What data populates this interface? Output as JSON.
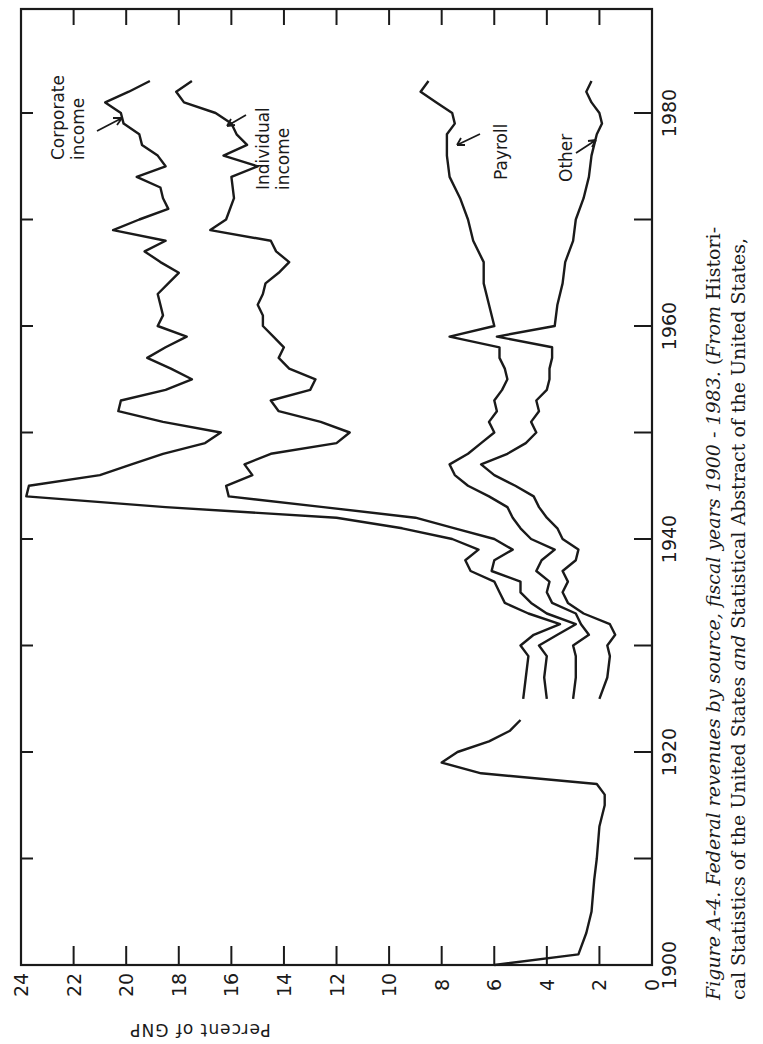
{
  "caption": {
    "line1_italic": "Figure A-4.   Federal revenues by source, fiscal years 1900 - 1983.",
    "line1_roman_prefix": "(",
    "line1_italic_from": "From",
    "line1_roman": " Histori-",
    "line2_a": "cal Statistics of the United States ",
    "line2_italic": "and",
    "line2_b": " Statistical Abstract of the United States,"
  },
  "chart_data": {
    "type": "line",
    "title": "Federal revenues by source, fiscal years 1900 - 1983",
    "xlabel": "",
    "ylabel": "Percent of GNP",
    "xlim": [
      1900,
      1985
    ],
    "ylim": [
      0,
      24
    ],
    "x_ticks": [
      1900,
      1910,
      1920,
      1930,
      1940,
      1950,
      1960,
      1970,
      1980
    ],
    "x_tick_labels": [
      "1900",
      "",
      "1920",
      "",
      "1940",
      "",
      "1960",
      "",
      "1980"
    ],
    "y_ticks": [
      0,
      2,
      4,
      6,
      8,
      10,
      12,
      14,
      16,
      18,
      20,
      22,
      24
    ],
    "y_tick_labels": [
      "0",
      "2",
      "4",
      "6",
      "8",
      "10",
      "12",
      "14",
      "16",
      "18",
      "20",
      "22",
      "24"
    ],
    "grid": false,
    "orientation": "rotated 90 degrees clockwise (years run bottom-to-top along the right side, percent runs right-to-left along the bottom)",
    "stacking": "cumulative; each line is the running total including the sources below it",
    "series": [
      {
        "name": "Total (pre-1925)",
        "x": [
          1900,
          1901,
          1903,
          1905,
          1908,
          1910,
          1913,
          1915,
          1916,
          1917,
          1918,
          1919,
          1920,
          1921,
          1922,
          1923
        ],
        "values": [
          6.0,
          2.8,
          2.5,
          2.3,
          2.2,
          2.1,
          2.0,
          1.8,
          1.8,
          2.1,
          6.5,
          8.0,
          7.4,
          6.2,
          5.4,
          5.0
        ]
      },
      {
        "name": "Other",
        "label": "Other",
        "x": [
          1925,
          1927,
          1929,
          1930,
          1931,
          1932,
          1933,
          1934,
          1935,
          1936,
          1937,
          1938,
          1939,
          1940,
          1941,
          1942,
          1943,
          1944,
          1945,
          1946,
          1947,
          1948,
          1949,
          1950,
          1951,
          1952,
          1953,
          1954,
          1955,
          1956,
          1957,
          1958,
          1959,
          1960,
          1962,
          1964,
          1966,
          1968,
          1970,
          1972,
          1974,
          1976,
          1978,
          1979,
          1980,
          1981,
          1982,
          1983
        ],
        "values": [
          2.0,
          1.7,
          1.6,
          1.7,
          1.4,
          1.6,
          2.6,
          3.2,
          3.4,
          3.2,
          3.4,
          2.9,
          2.8,
          3.4,
          3.6,
          4.0,
          4.3,
          4.5,
          5.2,
          6.0,
          6.5,
          5.5,
          4.8,
          4.4,
          4.6,
          4.3,
          4.4,
          4.0,
          3.9,
          3.9,
          3.8,
          3.8,
          5.9,
          3.7,
          3.6,
          3.4,
          3.3,
          3.0,
          2.9,
          2.6,
          2.4,
          2.3,
          2.1,
          1.9,
          2.0,
          2.3,
          2.5,
          2.3
        ]
      },
      {
        "name": "Payroll",
        "label": "Payroll",
        "x": [
          1925,
          1927,
          1929,
          1930,
          1931,
          1932,
          1933,
          1934,
          1935,
          1936,
          1937,
          1938,
          1939,
          1940,
          1941,
          1942,
          1943,
          1944,
          1945,
          1946,
          1947,
          1948,
          1949,
          1950,
          1951,
          1952,
          1953,
          1954,
          1955,
          1956,
          1957,
          1958,
          1959,
          1960,
          1962,
          1964,
          1966,
          1968,
          1970,
          1972,
          1974,
          1976,
          1978,
          1979,
          1980,
          1981,
          1982,
          1983
        ],
        "values": [
          3.0,
          2.9,
          2.9,
          3.0,
          2.4,
          2.7,
          2.9,
          3.8,
          4.0,
          3.9,
          4.4,
          4.2,
          3.7,
          4.6,
          5.0,
          5.3,
          5.5,
          6.2,
          7.0,
          7.5,
          7.7,
          7.0,
          6.5,
          6.0,
          6.2,
          5.9,
          6.0,
          5.7,
          5.5,
          5.6,
          5.8,
          5.8,
          7.7,
          6.0,
          6.2,
          6.4,
          6.4,
          6.8,
          7.0,
          7.3,
          7.7,
          7.8,
          7.8,
          7.5,
          7.6,
          8.2,
          8.8,
          8.5
        ]
      },
      {
        "name": "Individual income",
        "label": "Individual income",
        "x": [
          1925,
          1927,
          1929,
          1930,
          1931,
          1932,
          1933,
          1934,
          1935,
          1936,
          1937,
          1938,
          1939,
          1940,
          1941,
          1942,
          1943,
          1944,
          1945,
          1946,
          1947,
          1948,
          1949,
          1950,
          1951,
          1952,
          1953,
          1954,
          1955,
          1956,
          1957,
          1958,
          1959,
          1960,
          1961,
          1962,
          1963,
          1964,
          1965,
          1966,
          1967,
          1968,
          1969,
          1970,
          1972,
          1974,
          1975,
          1976,
          1977,
          1978,
          1979,
          1980,
          1981,
          1982,
          1983
        ],
        "values": [
          4.0,
          4.1,
          4.0,
          4.3,
          3.6,
          2.9,
          4.0,
          4.6,
          5.0,
          5.0,
          6.1,
          6.0,
          5.3,
          6.0,
          7.5,
          9.0,
          12.5,
          16.1,
          16.2,
          15.2,
          15.5,
          14.5,
          12.0,
          11.5,
          12.6,
          14.2,
          14.5,
          13.0,
          12.8,
          13.8,
          14.2,
          14.0,
          14.4,
          14.8,
          14.8,
          15.0,
          14.8,
          14.7,
          14.2,
          13.8,
          14.3,
          14.5,
          16.8,
          16.2,
          15.9,
          16.0,
          15.0,
          16.3,
          15.4,
          15.8,
          16.0,
          16.6,
          17.8,
          18.1,
          17.5
        ]
      },
      {
        "name": "Corporate income",
        "label": "Corporate income",
        "x": [
          1925,
          1927,
          1929,
          1930,
          1931,
          1932,
          1933,
          1934,
          1935,
          1936,
          1937,
          1938,
          1939,
          1940,
          1941,
          1942,
          1943,
          1944,
          1945,
          1946,
          1947,
          1948,
          1949,
          1950,
          1951,
          1952,
          1953,
          1954,
          1955,
          1956,
          1957,
          1958,
          1959,
          1960,
          1961,
          1962,
          1963,
          1964,
          1965,
          1966,
          1967,
          1968,
          1969,
          1970,
          1971,
          1972,
          1973,
          1974,
          1975,
          1976,
          1977,
          1978,
          1979,
          1980,
          1981,
          1982,
          1983
        ],
        "values": [
          4.9,
          4.8,
          4.7,
          5.0,
          4.5,
          3.5,
          4.7,
          5.6,
          5.8,
          6.0,
          6.9,
          7.1,
          6.6,
          7.6,
          9.5,
          12.0,
          18.5,
          23.8,
          23.7,
          21.0,
          19.8,
          18.6,
          17.0,
          16.4,
          18.6,
          20.3,
          20.2,
          18.5,
          17.5,
          18.3,
          19.2,
          18.5,
          17.7,
          18.8,
          18.6,
          18.7,
          18.8,
          18.4,
          18.0,
          18.7,
          19.3,
          18.5,
          20.5,
          19.5,
          18.4,
          18.6,
          18.7,
          19.6,
          18.5,
          18.8,
          19.4,
          19.5,
          20.1,
          20.2,
          20.8,
          19.9,
          19.1
        ]
      }
    ],
    "annotations": [
      "Corporate income",
      "Individual income",
      "Payroll",
      "Other"
    ]
  }
}
